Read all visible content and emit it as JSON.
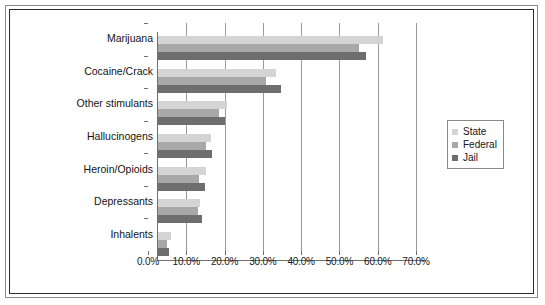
{
  "chart_data": {
    "type": "bar",
    "orientation": "horizontal",
    "title": "",
    "xlabel": "",
    "ylabel": "",
    "categories": [
      "Marijuana",
      "Cocaine/Crack",
      "Other stimulants",
      "Hallucinogens",
      "Heroin/Opioids",
      "Depressants",
      "Inhalents"
    ],
    "series": [
      {
        "name": "State",
        "color": "#d4d4d4",
        "values": [
          58.7,
          30.8,
          18.1,
          13.9,
          12.6,
          11.1,
          3.3
        ]
      },
      {
        "name": "Federal",
        "color": "#a8a8a8",
        "values": [
          52.4,
          28.3,
          16.0,
          12.6,
          10.6,
          10.4,
          2.3
        ]
      },
      {
        "name": "Jail",
        "color": "#6e6e6e",
        "values": [
          54.2,
          32.0,
          17.5,
          14.1,
          12.3,
          11.6,
          3.0
        ]
      }
    ],
    "xlim": [
      0,
      70
    ],
    "xticks": [
      0,
      10,
      20,
      30,
      40,
      50,
      60,
      70
    ],
    "xtick_labels": [
      "0.0%",
      "10.0%",
      "20.0%",
      "30.0%",
      "40.0%",
      "50.0%",
      "60.0%",
      "70.0%"
    ],
    "grid": "vertical",
    "legend_position": "right",
    "legend": [
      "State",
      "Federal",
      "Jail"
    ]
  }
}
